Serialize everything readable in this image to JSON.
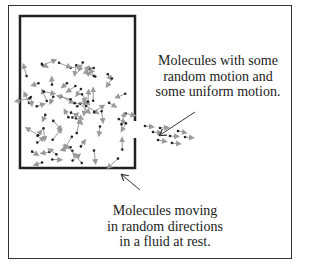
{
  "diagram": {
    "label_top": [
      "Molecules with some",
      "random motion and",
      "some uniform motion."
    ],
    "label_bottom": [
      "Molecules moving",
      "in random directions",
      "in a fluid at rest."
    ],
    "colors": {
      "frame": "#333333",
      "container": "#222222",
      "molecule": "#222222",
      "arrow": "#9a9a9a",
      "pointer": "#333333"
    }
  }
}
